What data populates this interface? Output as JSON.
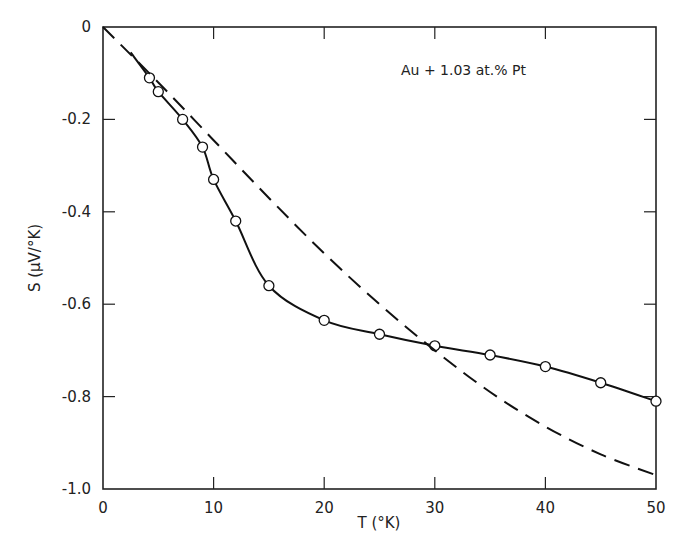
{
  "chart_data": {
    "type": "line",
    "title": "",
    "annotation": "Au + 1.03 at.% Pt",
    "xlabel": "T (°K)",
    "ylabel": "S (μV/°K)",
    "xlim": [
      0,
      50
    ],
    "ylim": [
      -1.0,
      0
    ],
    "xticks": [
      0,
      10,
      20,
      30,
      40,
      50
    ],
    "yticks": [
      0,
      -0.2,
      -0.4,
      -0.6,
      -0.8,
      -1.0
    ],
    "xtick_labels": [
      "0",
      "10",
      "20",
      "30",
      "40",
      "50"
    ],
    "ytick_labels": [
      "0",
      "-0.2",
      "-0.4",
      "-0.6",
      "-0.8",
      "-1.0"
    ],
    "grid": false,
    "series": [
      {
        "name": "measured",
        "style": "open-circles-solid-line",
        "x": [
          4.2,
          5,
          7.2,
          9,
          10,
          12,
          15,
          20,
          25,
          30,
          35,
          40,
          45,
          50
        ],
        "y": [
          -0.11,
          -0.14,
          -0.2,
          -0.26,
          -0.33,
          -0.42,
          -0.56,
          -0.635,
          -0.665,
          -0.69,
          -0.71,
          -0.735,
          -0.77,
          -0.81
        ]
      },
      {
        "name": "theory",
        "style": "dashed",
        "x": [
          0,
          5,
          10,
          15,
          20,
          25,
          30,
          35,
          40,
          45,
          50
        ],
        "y": [
          0,
          -0.12,
          -0.245,
          -0.37,
          -0.49,
          -0.6,
          -0.7,
          -0.79,
          -0.865,
          -0.925,
          -0.97
        ]
      }
    ]
  }
}
